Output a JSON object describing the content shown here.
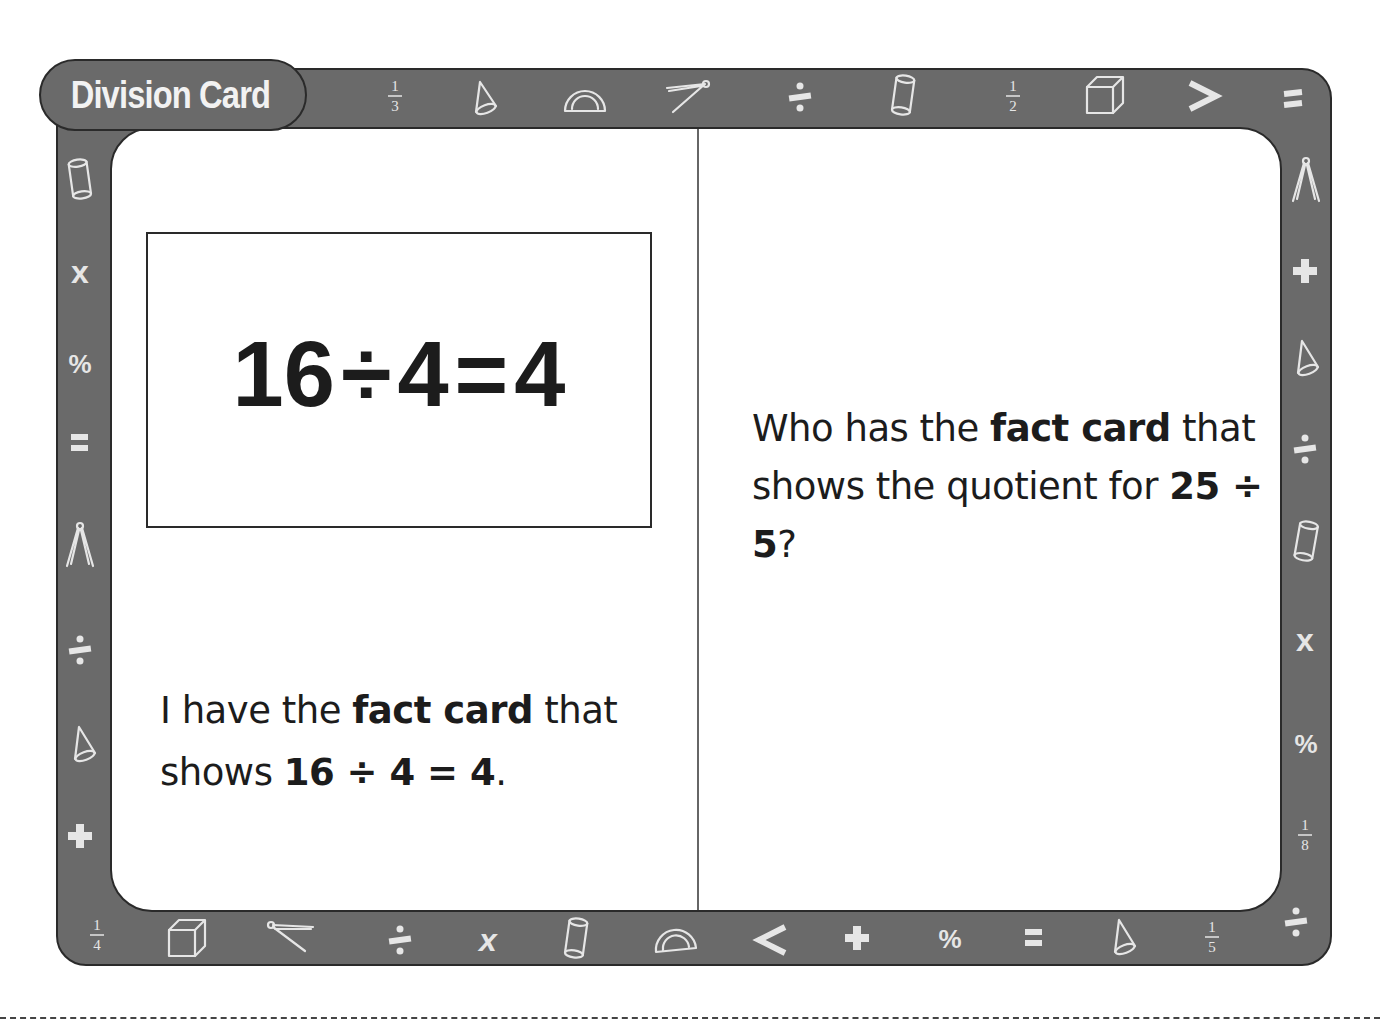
{
  "card": {
    "title": "Division Card",
    "colors": {
      "frame": "#6a6a6a",
      "frame_outline": "#2a2a2a",
      "icon": "#e6e6e6",
      "card_bg": "#ffffff",
      "text": "#1c1c1c"
    },
    "left_panel": {
      "fact_box": {
        "dividend": "16",
        "operator": "÷",
        "divisor": "4",
        "equals": "=",
        "quotient": "4"
      },
      "statement": {
        "part1": "I have the ",
        "bold1": "fact card",
        "part2": " that shows ",
        "bold2": "16 ÷ 4 = 4",
        "part3": "."
      }
    },
    "right_panel": {
      "question": {
        "part1": "Who has the ",
        "bold1": "fact card",
        "part2": " that shows the quotient for ",
        "bold2": "25 ÷ 5",
        "part3": "?"
      }
    },
    "border_icons": {
      "top": [
        "fraction-1-3",
        "cone",
        "protractor",
        "compass",
        "divide",
        "cylinder",
        "fraction-1-2",
        "cube",
        "greater-than",
        "equals"
      ],
      "left": [
        "cylinder",
        "times",
        "percent",
        "equals",
        "compass",
        "divide",
        "cone",
        "plus",
        "fraction-1-4"
      ],
      "right": [
        "compass",
        "plus",
        "cone",
        "divide",
        "cylinder",
        "times",
        "percent",
        "fraction-1-8",
        "divide"
      ],
      "bottom": [
        "cube",
        "compass",
        "divide",
        "times",
        "cylinder",
        "protractor",
        "less-than",
        "plus",
        "percent",
        "equals",
        "cone",
        "fraction-1-5"
      ]
    },
    "fractions": {
      "one_third": {
        "num": "1",
        "den": "3"
      },
      "one_half": {
        "num": "1",
        "den": "2"
      },
      "one_quarter": {
        "num": "1",
        "den": "4"
      },
      "one_eighth": {
        "num": "1",
        "den": "8"
      },
      "one_fifth": {
        "num": "1",
        "den": "5"
      }
    },
    "symbols": {
      "percent": "%",
      "greater_than": ">",
      "less_than": "<"
    }
  }
}
